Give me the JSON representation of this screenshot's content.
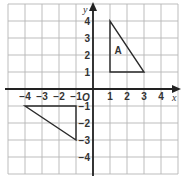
{
  "chart_data": {
    "type": "diagram",
    "title": "",
    "xlabel": "x",
    "ylabel": "y",
    "origin_label": "O",
    "xlim": [
      -5,
      5
    ],
    "ylim": [
      -5,
      5
    ],
    "grid": true,
    "x_ticks": [
      -4,
      -3,
      -2,
      -1,
      1,
      2,
      3,
      4
    ],
    "y_ticks": [
      4,
      3,
      2,
      1,
      -1,
      -2,
      -3,
      -4
    ],
    "x_tick_labels": [
      "−4",
      "−3",
      "−2",
      "−1",
      "1",
      "2",
      "3",
      "4"
    ],
    "y_tick_labels": [
      "4",
      "3",
      "2",
      "1",
      "−1",
      "−2",
      "−3",
      "−4"
    ],
    "shapes": [
      {
        "name": "A",
        "label": "A",
        "type": "triangle",
        "vertices": [
          [
            1,
            1
          ],
          [
            1,
            4
          ],
          [
            3,
            1
          ]
        ],
        "label_pos": [
          1.5,
          2.3
        ]
      },
      {
        "name": "image",
        "label": "",
        "type": "triangle",
        "vertices": [
          [
            -4,
            -1
          ],
          [
            -1,
            -1
          ],
          [
            -1,
            -3
          ]
        ]
      }
    ]
  }
}
